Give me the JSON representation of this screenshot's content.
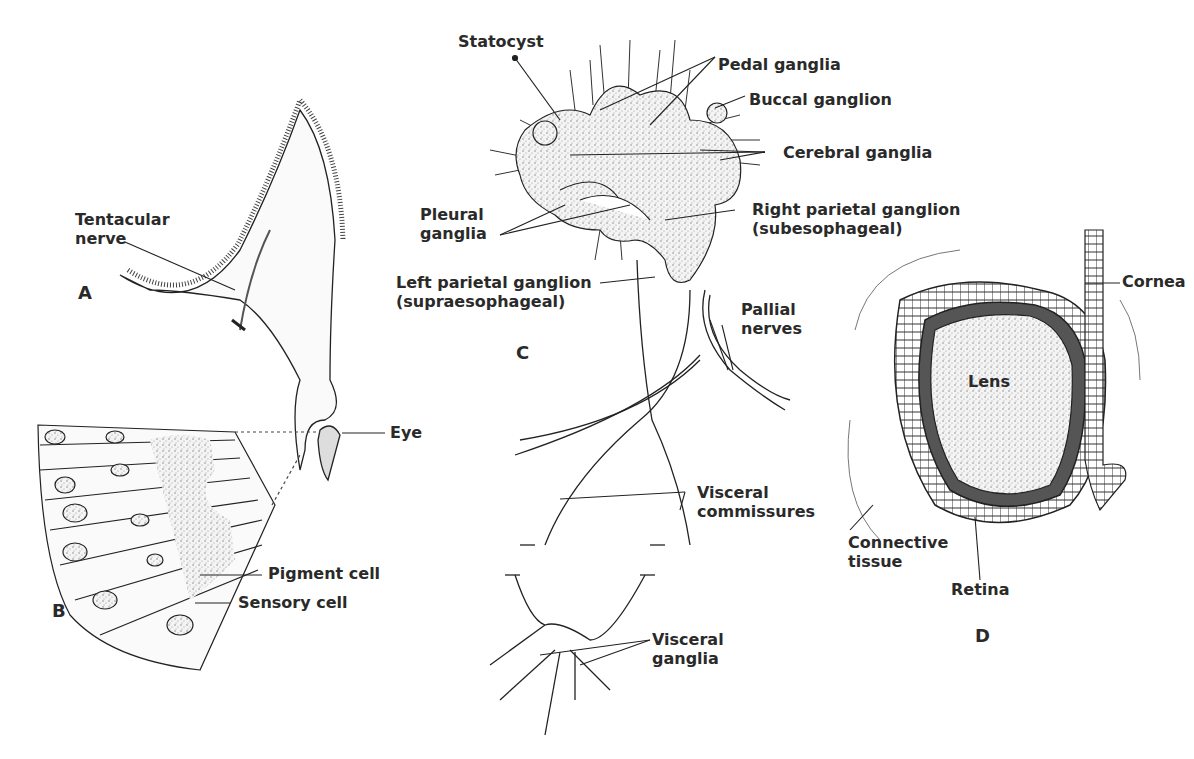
{
  "figure": {
    "panels": [
      {
        "id": "A",
        "label": "A",
        "labels": [
          "Tentacular nerve",
          "Eye"
        ]
      },
      {
        "id": "B",
        "label": "B",
        "labels": [
          "Pigment cell",
          "Sensory cell"
        ]
      },
      {
        "id": "C",
        "label": "C",
        "labels": [
          "Statocyst",
          "Pedal ganglia",
          "Buccal ganglion",
          "Cerebral ganglia",
          "Pleural ganglia",
          "Right parietal ganglion (subesophageal)",
          "Left parietal ganglion (supraesophageal)",
          "Pallial nerves",
          "Visceral commissures",
          "Visceral ganglia"
        ]
      },
      {
        "id": "D",
        "label": "D",
        "labels": [
          "Cornea",
          "Lens",
          "Connective tissue",
          "Retina"
        ]
      }
    ],
    "text": {
      "tentacular_1": "Tentacular",
      "tentacular_2": "nerve",
      "eye": "Eye",
      "pigment": "Pigment cell",
      "sensory": "Sensory cell",
      "statocyst": "Statocyst",
      "pedal": "Pedal ganglia",
      "buccal": "Buccal ganglion",
      "cerebral": "Cerebral ganglia",
      "pleural_1": "Pleural",
      "pleural_2": "ganglia",
      "rpg_1": "Right parietal ganglion",
      "rpg_2": "(subesophageal)",
      "lpg_1": "Left parietal ganglion",
      "lpg_2": "(supraesophageal)",
      "pallial_1": "Pallial",
      "pallial_2": "nerves",
      "visc_comm_1": "Visceral",
      "visc_comm_2": "commissures",
      "visc_gang_1": "Visceral",
      "visc_gang_2": "ganglia",
      "cornea": "Cornea",
      "lens": "Lens",
      "connective_1": "Connective",
      "connective_2": "tissue",
      "retina": "Retina",
      "panel_a": "A",
      "panel_b": "B",
      "panel_c": "C",
      "panel_d": "D"
    }
  }
}
